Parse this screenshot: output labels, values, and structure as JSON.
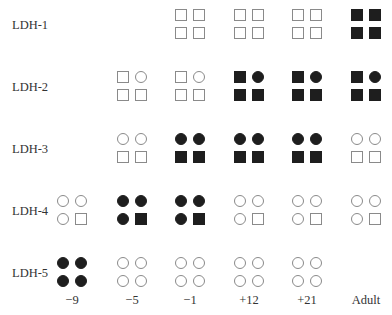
{
  "figure": {
    "rows": [
      "LDH-1",
      "LDH-2",
      "LDH-3",
      "LDH-4",
      "LDH-5"
    ],
    "columns": [
      "−9",
      "−5",
      "−1",
      "+12",
      "+21",
      "Adult"
    ],
    "legend_note": "Each tetramer drawn as 2x2 subunits; square = one subunit type, circle = other subunit type; filled = present/expressed, open = absent",
    "cells": [
      [
        null,
        null,
        {
          "shapes": [
            "square",
            "square",
            "square",
            "square"
          ],
          "filled": false
        },
        {
          "shapes": [
            "square",
            "square",
            "square",
            "square"
          ],
          "filled": false
        },
        {
          "shapes": [
            "square",
            "square",
            "square",
            "square"
          ],
          "filled": false
        },
        {
          "shapes": [
            "square",
            "square",
            "square",
            "square"
          ],
          "filled": true
        }
      ],
      [
        null,
        {
          "shapes": [
            "square",
            "circle",
            "square",
            "square"
          ],
          "filled": false
        },
        {
          "shapes": [
            "square",
            "circle",
            "square",
            "square"
          ],
          "filled": false
        },
        {
          "shapes": [
            "square",
            "circle",
            "square",
            "square"
          ],
          "filled": true
        },
        {
          "shapes": [
            "square",
            "circle",
            "square",
            "square"
          ],
          "filled": true
        },
        {
          "shapes": [
            "square",
            "circle",
            "square",
            "square"
          ],
          "filled": true
        }
      ],
      [
        null,
        {
          "shapes": [
            "circle",
            "circle",
            "square",
            "square"
          ],
          "filled": false
        },
        {
          "shapes": [
            "circle",
            "circle",
            "square",
            "square"
          ],
          "filled": true
        },
        {
          "shapes": [
            "circle",
            "circle",
            "square",
            "square"
          ],
          "filled": true
        },
        {
          "shapes": [
            "circle",
            "circle",
            "square",
            "square"
          ],
          "filled": true
        },
        {
          "shapes": [
            "circle",
            "circle",
            "square",
            "square"
          ],
          "filled": false
        }
      ],
      [
        {
          "shapes": [
            "circle",
            "circle",
            "circle",
            "square"
          ],
          "filled": false
        },
        {
          "shapes": [
            "circle",
            "circle",
            "circle",
            "square"
          ],
          "filled": true
        },
        {
          "shapes": [
            "circle",
            "circle",
            "circle",
            "square"
          ],
          "filled": true
        },
        {
          "shapes": [
            "circle",
            "circle",
            "circle",
            "square"
          ],
          "filled": false
        },
        {
          "shapes": [
            "circle",
            "circle",
            "circle",
            "square"
          ],
          "filled": false
        },
        {
          "shapes": [
            "circle",
            "circle",
            "circle",
            "square"
          ],
          "filled": false
        }
      ],
      [
        {
          "shapes": [
            "circle",
            "circle",
            "circle",
            "circle"
          ],
          "filled": true
        },
        {
          "shapes": [
            "circle",
            "circle",
            "circle",
            "circle"
          ],
          "filled": false
        },
        {
          "shapes": [
            "circle",
            "circle",
            "circle",
            "circle"
          ],
          "filled": false
        },
        {
          "shapes": [
            "circle",
            "circle",
            "circle",
            "circle"
          ],
          "filled": false
        },
        {
          "shapes": [
            "circle",
            "circle",
            "circle",
            "circle"
          ],
          "filled": false
        },
        null
      ]
    ]
  }
}
